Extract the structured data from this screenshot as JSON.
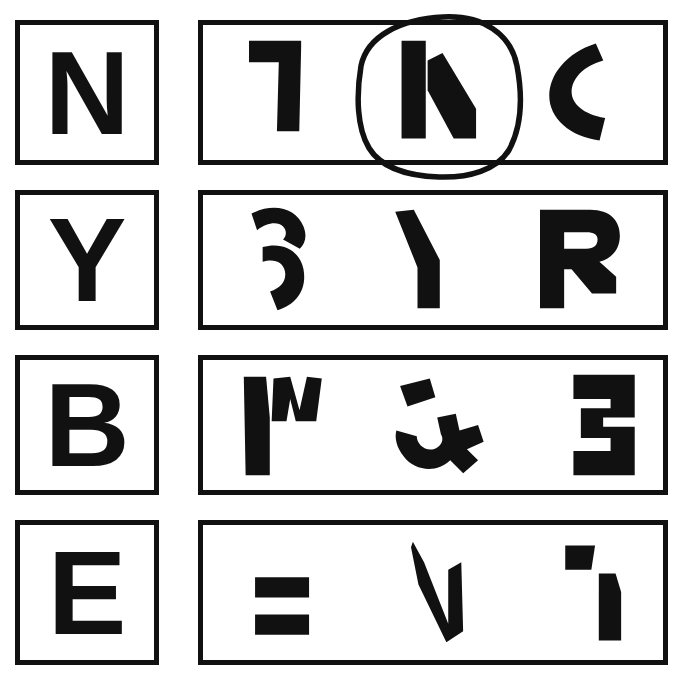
{
  "page": {
    "background_color": "#ffffff",
    "ink_color": "#111111",
    "width": 681,
    "height": 688
  },
  "rows": [
    {
      "id": "row-n",
      "cue": {
        "letter": "N",
        "label": "cue-letter-n"
      },
      "choices": [
        {
          "id": "choice-n-1",
          "shape_name": "seven-hook-fragment",
          "selected": false
        },
        {
          "id": "choice-n-2",
          "shape_name": "n-fragment",
          "selected": true
        },
        {
          "id": "choice-n-3",
          "shape_name": "c-crescent",
          "selected": false
        }
      ],
      "annotation": {
        "type": "hand-drawn-circle",
        "target": "choice-n-2"
      }
    },
    {
      "id": "row-y",
      "cue": {
        "letter": "Y",
        "label": "cue-letter-y"
      },
      "choices": [
        {
          "id": "choice-y-1",
          "shape_name": "s-curl-fragment",
          "selected": false
        },
        {
          "id": "choice-y-2",
          "shape_name": "y-stem-fragment",
          "selected": false
        },
        {
          "id": "choice-y-3",
          "shape_name": "r-block-fragment",
          "selected": false
        }
      ],
      "annotation": null
    },
    {
      "id": "row-b",
      "cue": {
        "letter": "B",
        "label": "cue-letter-b"
      },
      "choices": [
        {
          "id": "choice-b-1",
          "shape_name": "m-fragment",
          "selected": false
        },
        {
          "id": "choice-b-2",
          "shape_name": "scattered-blob-fragment",
          "selected": false
        },
        {
          "id": "choice-b-3",
          "shape_name": "three-fragment",
          "selected": false
        }
      ],
      "annotation": null
    },
    {
      "id": "row-e",
      "cue": {
        "letter": "E",
        "label": "cue-letter-e"
      },
      "choices": [
        {
          "id": "choice-e-1",
          "shape_name": "equals-bars-fragment",
          "selected": false
        },
        {
          "id": "choice-e-2",
          "shape_name": "v-check-fragment",
          "selected": false
        },
        {
          "id": "choice-e-3",
          "shape_name": "one-flag-fragment",
          "selected": false
        }
      ],
      "annotation": null
    }
  ]
}
